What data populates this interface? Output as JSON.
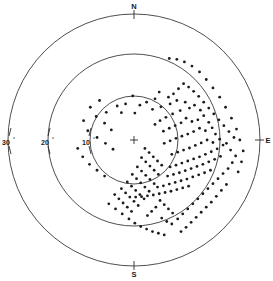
{
  "figure": {
    "kind": "polar-scatter-diagram",
    "center": {
      "x": 134,
      "y": 140
    },
    "center_marker": "plus-cross",
    "background_color": "#ffffff",
    "line_color": "#3a3a3a",
    "dot_color": "#1c1c1c"
  },
  "cardinal_labels": [
    {
      "name": "north",
      "text": "N",
      "x": 134,
      "y": 9,
      "tick": {
        "x1": 134,
        "y1": 11,
        "x2": 134,
        "y2": 19
      }
    },
    {
      "name": "east",
      "text": "E",
      "x": 266,
      "y": 142,
      "tick": {
        "x1": 255,
        "y1": 140,
        "x2": 263,
        "y2": 140
      }
    },
    {
      "name": "south",
      "text": "S",
      "x": 134,
      "y": 274,
      "tick": {
        "x1": 134,
        "y1": 261,
        "x2": 134,
        "y2": 269
      }
    }
  ],
  "ring_labels": [
    {
      "name": "ring-10",
      "value": "10",
      "degree_symbol": "°",
      "radius": 44,
      "label_x": 89,
      "label_y": 143
    },
    {
      "name": "ring-20",
      "value": "20",
      "degree_symbol": "°",
      "radius": 86,
      "label_x": 46,
      "label_y": 143
    },
    {
      "name": "ring-30",
      "value": "30",
      "degree_symbol": "°",
      "radius": 126,
      "label_x": 7,
      "label_y": 143
    }
  ],
  "chart_data": {
    "type": "scatter",
    "title": "",
    "subtitle": "",
    "xlabel": "",
    "ylabel": "",
    "projection": "polar",
    "grid": true,
    "legend_position": "none",
    "radial_axis": {
      "label": "",
      "unit": "degrees",
      "ticks": [
        10,
        20,
        30
      ],
      "tick_labels": [
        "10°",
        "20°",
        "30°"
      ],
      "rlim": [
        0,
        30
      ],
      "tick_side": "west"
    },
    "angular_axis": {
      "labels": [
        "N",
        "E",
        "S"
      ],
      "label_angles_deg": [
        0,
        90,
        180
      ],
      "direction": "clockwise",
      "zero_at": "north"
    },
    "series": [
      {
        "name": "observations",
        "marker": "dot",
        "marker_size": 1.4,
        "color": "#1c1c1c",
        "count": 206,
        "points_xy": [
          [
            -0.3,
            10.5
          ],
          [
            5.0,
            9.8
          ],
          [
            3.0,
            9.0
          ],
          [
            1.4,
            8.3
          ],
          [
            -2.0,
            8.6
          ],
          [
            -4.0,
            8.1
          ],
          [
            -6.6,
            6.6
          ],
          [
            -3.0,
            6.5
          ],
          [
            0.2,
            6.4
          ],
          [
            4.4,
            7.3
          ],
          [
            6.4,
            7.9
          ],
          [
            8.6,
            8.6
          ],
          [
            10.2,
            9.4
          ],
          [
            12.2,
            9.0
          ],
          [
            13.2,
            7.6
          ],
          [
            11.0,
            7.0
          ],
          [
            9.2,
            6.2
          ],
          [
            7.6,
            5.4
          ],
          [
            6.2,
            4.6
          ],
          [
            5.0,
            3.7
          ],
          [
            14.4,
            8.3
          ],
          [
            15.8,
            7.1
          ],
          [
            16.6,
            5.8
          ],
          [
            15.2,
            4.8
          ],
          [
            13.8,
            4.4
          ],
          [
            12.4,
            5.2
          ],
          [
            11.2,
            4.1
          ],
          [
            9.8,
            3.4
          ],
          [
            8.4,
            2.8
          ],
          [
            7.0,
            2.1
          ],
          [
            17.8,
            4.2
          ],
          [
            18.6,
            2.9
          ],
          [
            17.0,
            2.2
          ],
          [
            15.6,
            2.8
          ],
          [
            14.2,
            2.0
          ],
          [
            12.8,
            1.4
          ],
          [
            11.4,
            0.9
          ],
          [
            10.0,
            0.4
          ],
          [
            8.6,
            -0.2
          ],
          [
            7.2,
            -0.8
          ],
          [
            19.4,
            1.4
          ],
          [
            20.4,
            0.2
          ],
          [
            18.8,
            -0.6
          ],
          [
            17.4,
            0.0
          ],
          [
            16.0,
            -0.7
          ],
          [
            14.6,
            -1.3
          ],
          [
            13.2,
            -1.9
          ],
          [
            11.8,
            -2.4
          ],
          [
            10.4,
            -2.9
          ],
          [
            9.0,
            -3.4
          ],
          [
            21.2,
            -1.2
          ],
          [
            19.8,
            -2.1
          ],
          [
            18.4,
            -2.8
          ],
          [
            17.0,
            -3.4
          ],
          [
            15.6,
            -4.0
          ],
          [
            14.2,
            -4.5
          ],
          [
            12.8,
            -5.0
          ],
          [
            11.4,
            -5.5
          ],
          [
            10.0,
            -6.0
          ],
          [
            8.6,
            -6.4
          ],
          [
            20.6,
            -3.9
          ],
          [
            19.2,
            -4.6
          ],
          [
            17.8,
            -5.2
          ],
          [
            16.4,
            -5.8
          ],
          [
            15.0,
            -6.3
          ],
          [
            13.6,
            -6.8
          ],
          [
            12.2,
            -7.3
          ],
          [
            10.8,
            -7.8
          ],
          [
            9.4,
            -8.2
          ],
          [
            8.0,
            -8.6
          ],
          [
            18.2,
            -7.2
          ],
          [
            16.8,
            -7.8
          ],
          [
            15.4,
            -8.3
          ],
          [
            14.0,
            -8.8
          ],
          [
            12.6,
            -9.3
          ],
          [
            11.2,
            -9.7
          ],
          [
            9.8,
            -10.1
          ],
          [
            8.4,
            -10.5
          ],
          [
            7.0,
            -10.9
          ],
          [
            5.6,
            -11.2
          ],
          [
            13.0,
            -11.0
          ],
          [
            11.6,
            -11.4
          ],
          [
            10.2,
            -11.8
          ],
          [
            8.8,
            -12.2
          ],
          [
            7.4,
            -12.5
          ],
          [
            6.0,
            -12.8
          ],
          [
            4.6,
            -13.1
          ],
          [
            3.2,
            -13.3
          ],
          [
            1.8,
            -13.5
          ],
          [
            0.4,
            -13.6
          ],
          [
            2.6,
            -2.0
          ],
          [
            3.6,
            -3.0
          ],
          [
            4.6,
            -4.0
          ],
          [
            5.6,
            -5.0
          ],
          [
            6.6,
            -6.0
          ],
          [
            1.8,
            -4.2
          ],
          [
            2.8,
            -5.2
          ],
          [
            3.8,
            -6.2
          ],
          [
            4.8,
            -7.2
          ],
          [
            5.8,
            -8.2
          ],
          [
            0.8,
            -6.4
          ],
          [
            1.8,
            -7.4
          ],
          [
            2.8,
            -8.4
          ],
          [
            3.8,
            -9.4
          ],
          [
            4.8,
            -10.4
          ],
          [
            -0.4,
            -8.2
          ],
          [
            0.6,
            -9.2
          ],
          [
            1.6,
            -10.2
          ],
          [
            2.6,
            -11.2
          ],
          [
            3.6,
            -12.2
          ],
          [
            -1.6,
            -10.0
          ],
          [
            -0.6,
            -11.0
          ],
          [
            0.4,
            -12.0
          ],
          [
            1.4,
            -13.0
          ],
          [
            2.4,
            -14.0
          ],
          [
            -3.0,
            -11.6
          ],
          [
            -2.0,
            -12.6
          ],
          [
            -1.0,
            -13.6
          ],
          [
            0.0,
            -14.6
          ],
          [
            1.0,
            -15.6
          ],
          [
            -4.6,
            -13.0
          ],
          [
            -3.6,
            -14.0
          ],
          [
            -2.6,
            -15.0
          ],
          [
            -1.6,
            -16.0
          ],
          [
            -0.6,
            -17.0
          ],
          [
            6.2,
            -14.4
          ],
          [
            7.2,
            -15.4
          ],
          [
            8.2,
            -16.4
          ],
          [
            9.2,
            -17.4
          ],
          [
            5.2,
            -16.0
          ],
          [
            4.2,
            -17.0
          ],
          [
            3.2,
            -18.0
          ],
          [
            6.6,
            -18.6
          ],
          [
            7.8,
            -19.4
          ],
          [
            9.0,
            -20.0
          ],
          [
            10.4,
            -18.8
          ],
          [
            11.6,
            -17.6
          ],
          [
            12.8,
            -16.4
          ],
          [
            14.0,
            -15.2
          ],
          [
            15.2,
            -14.0
          ],
          [
            16.4,
            -12.8
          ],
          [
            17.6,
            -11.6
          ],
          [
            18.8,
            -10.4
          ],
          [
            20.0,
            -9.2
          ],
          [
            21.2,
            -8.0
          ],
          [
            22.4,
            -6.8
          ],
          [
            23.4,
            -5.4
          ],
          [
            24.2,
            -3.8
          ],
          [
            23.0,
            -2.4
          ],
          [
            22.0,
            -0.8
          ],
          [
            23.8,
            0.6
          ],
          [
            22.6,
            2.0
          ],
          [
            21.4,
            3.4
          ],
          [
            20.2,
            4.8
          ],
          [
            19.0,
            6.2
          ],
          [
            17.8,
            7.6
          ],
          [
            16.6,
            9.0
          ],
          [
            15.4,
            10.4
          ],
          [
            14.2,
            11.6
          ],
          [
            13.0,
            12.6
          ],
          [
            11.8,
            13.4
          ],
          [
            10.6,
            12.2
          ],
          [
            9.4,
            11.0
          ],
          [
            8.2,
            10.2
          ],
          [
            6.0,
            11.4
          ],
          [
            -8.2,
            9.4
          ],
          [
            -10.4,
            7.8
          ],
          [
            -9.0,
            5.6
          ],
          [
            -7.0,
            4.0
          ],
          [
            -5.4,
            2.4
          ],
          [
            -12.0,
            4.6
          ],
          [
            -11.0,
            2.2
          ],
          [
            -8.8,
            0.6
          ],
          [
            -6.8,
            -0.8
          ],
          [
            -5.0,
            -2.2
          ],
          [
            -13.4,
            -2.0
          ],
          [
            -12.2,
            -4.0
          ],
          [
            -10.6,
            -5.8
          ],
          [
            -8.8,
            -7.2
          ],
          [
            -7.0,
            -8.6
          ],
          [
            -6.0,
            -15.2
          ],
          [
            -4.4,
            -16.4
          ],
          [
            -2.8,
            -17.6
          ],
          [
            -1.2,
            -18.8
          ],
          [
            0.2,
            -19.8
          ],
          [
            1.6,
            -20.6
          ],
          [
            3.0,
            -21.2
          ],
          [
            4.4,
            -21.8
          ],
          [
            5.8,
            -22.2
          ],
          [
            7.2,
            -22.6
          ],
          [
            19.6,
            -13.4
          ],
          [
            20.8,
            -12.0
          ],
          [
            22.0,
            -10.6
          ],
          [
            18.4,
            -14.8
          ],
          [
            17.2,
            -16.0
          ],
          [
            16.0,
            -17.2
          ],
          [
            14.8,
            -18.4
          ],
          [
            13.6,
            -19.6
          ],
          [
            12.4,
            -20.8
          ],
          [
            11.2,
            -21.8
          ],
          [
            24.8,
            -7.6
          ],
          [
            25.6,
            -5.2
          ],
          [
            26.0,
            -2.6
          ],
          [
            25.2,
            0.0
          ],
          [
            24.4,
            2.6
          ],
          [
            23.2,
            5.2
          ],
          [
            21.8,
            7.8
          ],
          [
            20.4,
            10.2
          ],
          [
            18.8,
            12.4
          ],
          [
            17.2,
            14.4
          ],
          [
            15.6,
            16.2
          ],
          [
            13.8,
            17.6
          ],
          [
            12.0,
            18.6
          ],
          [
            10.2,
            19.2
          ],
          [
            8.4,
            19.4
          ]
        ]
      }
    ],
    "annotations": [
      {
        "name": "origin-cross",
        "symbol": "+",
        "r": 0,
        "theta": 0
      }
    ]
  }
}
